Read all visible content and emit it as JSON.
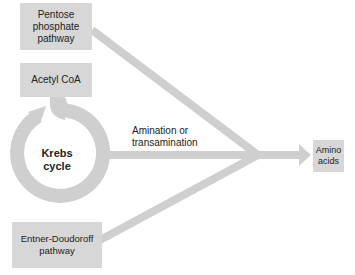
{
  "colors": {
    "box_fill": "#d7d7d7",
    "arrow_fill": "#cfcfcf",
    "text": "#222222",
    "background": "#ffffff"
  },
  "nodes": {
    "pentose": {
      "label": "Pentose\nphosphate\npathway"
    },
    "acetyl": {
      "label": "Acetyl CoA"
    },
    "krebs": {
      "label": "Krebs\ncycle"
    },
    "entner": {
      "label": "Entner-Doudoroff\npathway"
    },
    "amino": {
      "label": "Amino\nacids"
    }
  },
  "edges": {
    "process_label": "Amination or\ntransamination"
  }
}
